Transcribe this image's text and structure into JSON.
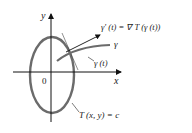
{
  "diagram": {
    "axes": {
      "x_label": "x",
      "y_label": "y",
      "origin_label": "0"
    },
    "curve_label": "γ",
    "point_label": "γ (t)",
    "gradient_label": "γ′ (t) = ∇ T (γ (t))",
    "level_curve_label": "T (x, y) = c",
    "colors": {
      "ellipse": "#6b6b6b",
      "curve": "#6b6b6b",
      "axes": "#111111",
      "text": "#222222"
    }
  }
}
